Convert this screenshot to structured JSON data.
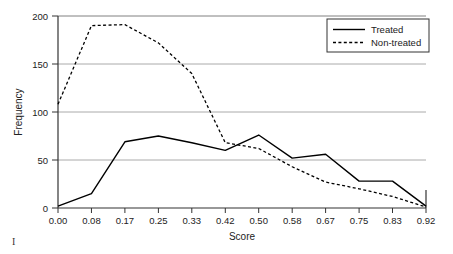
{
  "figure": {
    "mark_label": "I"
  },
  "chart_data": {
    "type": "line",
    "title": "",
    "xlabel": "Score",
    "ylabel": "Frequency",
    "categories": [
      "0.00",
      "0.08",
      "0.17",
      "0.25",
      "0.33",
      "0.42",
      "0.50",
      "0.58",
      "0.67",
      "0.75",
      "0.83",
      "0.92"
    ],
    "x": [
      0.0,
      0.08,
      0.17,
      0.25,
      0.33,
      0.42,
      0.5,
      0.58,
      0.67,
      0.75,
      0.83,
      0.92
    ],
    "series": [
      {
        "name": "Treated",
        "style": "solid",
        "color": "#000000",
        "values": [
          2,
          15,
          69,
          75,
          68,
          60,
          76,
          52,
          56,
          28,
          28,
          2
        ]
      },
      {
        "name": "Non-treated",
        "style": "dashed",
        "color": "#000000",
        "values": [
          108,
          190,
          191,
          172,
          140,
          68,
          62,
          43,
          27,
          20,
          12,
          1
        ]
      }
    ],
    "ylim": [
      0,
      200
    ],
    "yticks": [
      0,
      50,
      100,
      150,
      200
    ],
    "ytick_labels": [
      "0",
      "50",
      "100",
      "150",
      "200"
    ],
    "grid": true,
    "grid_axis": "y",
    "legend_position": "top-right",
    "legend_entries": [
      "Treated",
      "Non-treated"
    ]
  }
}
